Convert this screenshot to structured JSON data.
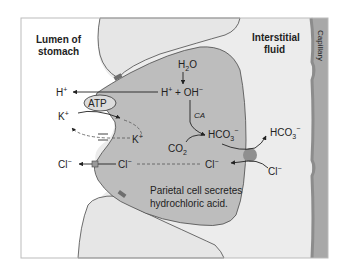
{
  "labels": {
    "lumen_line1": "Lumen of",
    "lumen_line2": "stomach",
    "interstitial_line1": "Interstitial",
    "interstitial_line2": "fluid",
    "capillary": "Capillary",
    "caption_line1": "Parietal cell secretes",
    "caption_line2": "hydrochloric acid."
  },
  "species": {
    "h2o": "H",
    "h2o_sub": "2",
    "h2o_tail": "O",
    "h_plus_lumen": "H",
    "h_plus_cell": "H",
    "plus_sup": "+",
    "oh": " + OH",
    "minus_sup": "−",
    "atp": "ATP",
    "k_lumen": "K",
    "k_cell": "K",
    "ca": "CA",
    "co2": "CO",
    "co2_sub": "2",
    "hco3_cell": "HCO",
    "hco3_interstitial": "HCO",
    "hco3_sub": "3",
    "cl_lumen": "Cl",
    "cl_cell_left": "Cl",
    "cl_cell_right": "Cl",
    "cl_interstitial": "Cl"
  },
  "colors": {
    "background": "#ffffff",
    "lumen_cells": "#e6e6e6",
    "interstitial": "#ececec",
    "parietal_cell": "#bdbdbd",
    "capillary": "#a8a8a8",
    "capillary_wall": "#8c8c8c",
    "antiporter": "#8f8f8f",
    "outline": "#4a4a4a"
  }
}
